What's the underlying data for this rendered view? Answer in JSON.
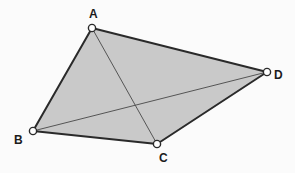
{
  "figure": {
    "kind": "geometry-quadrilateral-with-diagonals",
    "width": 295,
    "height": 173,
    "background_color": "#fbfbfb",
    "fill_color": "#c9c9c9",
    "edge_color": "#2a2a2a",
    "diagonal_color": "#555555",
    "marker_fill_color": "#ffffff",
    "marker_stroke_color": "#2a2a2a",
    "label_color": "#1c1c1c",
    "edge_width": 2,
    "diagonal_width": 1,
    "marker_radius": 3.6,
    "vertices": [
      {
        "id": "A",
        "label": "A",
        "x": 92,
        "y": 28,
        "label_x": 89,
        "label_y": 8
      },
      {
        "id": "B",
        "label": "B",
        "x": 33,
        "y": 131,
        "label_x": 14,
        "label_y": 134
      },
      {
        "id": "C",
        "label": "C",
        "x": 157,
        "y": 144,
        "label_x": 159,
        "label_y": 152
      },
      {
        "id": "D",
        "label": "D",
        "x": 267,
        "y": 72,
        "label_x": 274,
        "label_y": 69
      }
    ],
    "polygon_points": "92,28 267,72 157,144 33,131",
    "edges": [
      {
        "id": "AD",
        "from": "A",
        "to": "D",
        "x1": 92,
        "y1": 28,
        "x2": 267,
        "y2": 72
      },
      {
        "id": "DC",
        "from": "D",
        "to": "C",
        "x1": 267,
        "y1": 72,
        "x2": 157,
        "y2": 144
      },
      {
        "id": "CB",
        "from": "C",
        "to": "B",
        "x1": 157,
        "y1": 144,
        "x2": 33,
        "y2": 131
      },
      {
        "id": "BA",
        "from": "B",
        "to": "A",
        "x1": 33,
        "y1": 131,
        "x2": 92,
        "y2": 28
      }
    ],
    "diagonals": [
      {
        "id": "AC",
        "from": "A",
        "to": "C",
        "x1": 92,
        "y1": 28,
        "x2": 157,
        "y2": 144
      },
      {
        "id": "BD",
        "from": "B",
        "to": "D",
        "x1": 33,
        "y1": 131,
        "x2": 267,
        "y2": 72
      }
    ]
  }
}
